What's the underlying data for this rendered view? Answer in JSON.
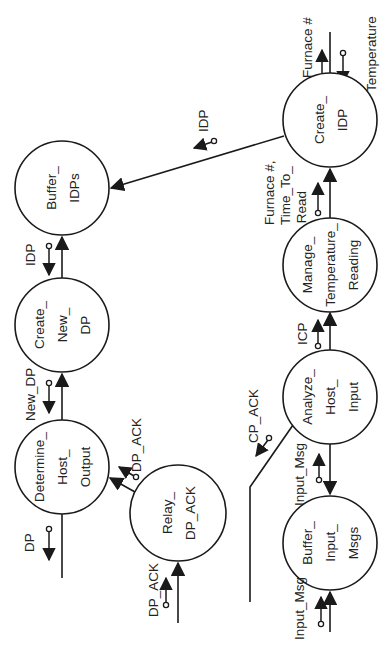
{
  "diagram": {
    "type": "structure-chart (rotated 90°)",
    "nodes": [
      {
        "id": "buffer_idps",
        "lines": [
          "Buffer_",
          "IDPs"
        ]
      },
      {
        "id": "create_idp",
        "lines": [
          "Create_",
          "IDP"
        ]
      },
      {
        "id": "create_new_dp",
        "lines": [
          "Create_",
          "New_",
          "DP"
        ]
      },
      {
        "id": "manage_temperature_reading",
        "lines": [
          "Manage_",
          "Temperature_",
          "Reading"
        ]
      },
      {
        "id": "determine_host_output",
        "lines": [
          "Determine_",
          "Host_",
          "Output"
        ]
      },
      {
        "id": "relay_dp_ack",
        "lines": [
          "Relay_",
          "DP_ACK"
        ]
      },
      {
        "id": "analyze_host_input",
        "lines": [
          "Analyze_",
          "Host_",
          "Input"
        ]
      },
      {
        "id": "buffer_input_msgs",
        "lines": [
          "Buffer_",
          "Input_",
          "Msgs"
        ]
      }
    ],
    "flows": [
      {
        "id": "furnace_no",
        "label": "Furnace #"
      },
      {
        "id": "temperature",
        "label": "Temperature"
      },
      {
        "id": "idp_create_to_buffer",
        "label": "IDP"
      },
      {
        "id": "furnace_time_to_read",
        "lines": [
          "Furnace #,",
          "Time_To_",
          "Read"
        ]
      },
      {
        "id": "icp",
        "label": "ICP"
      },
      {
        "id": "idp_buffer_to_newdp",
        "label": "IDP"
      },
      {
        "id": "new_dp",
        "label": "New_DP"
      },
      {
        "id": "dp_ack_relay_to_determine",
        "label": "DP_ACK"
      },
      {
        "id": "dp_out",
        "label": "DP"
      },
      {
        "id": "dp_ack_in",
        "label": "DP_ACK"
      },
      {
        "id": "cp_ack",
        "label": "CP_ACK"
      },
      {
        "id": "input_msg_between",
        "label": "Input_Msg"
      },
      {
        "id": "input_msg_in",
        "label": "Input_Msg"
      }
    ]
  }
}
